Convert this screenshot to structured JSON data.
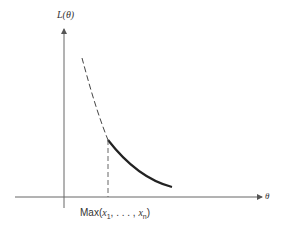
{
  "figure": {
    "y_axis_label": "L(θ)",
    "x_axis_label": "θ",
    "marker_label_prefix": "Max(",
    "marker_label_x1": "x",
    "marker_label_sub1": "1",
    "marker_label_mid": ", . . . , ",
    "marker_label_xn": "x",
    "marker_label_subn": "n",
    "marker_label_suffix": ")"
  },
  "colors": {
    "axis": "#555555",
    "curve": "#222222",
    "dashed": "#444444"
  }
}
